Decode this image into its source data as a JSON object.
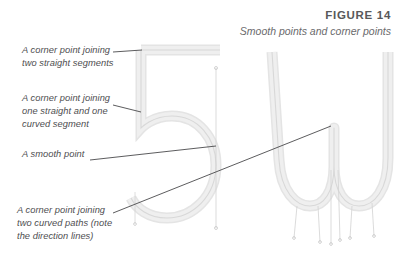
{
  "header": {
    "figure_number": "FIGURE 14",
    "caption": "Smooth points and corner points"
  },
  "annotations": [
    {
      "id": "corner-two-straight",
      "text": "A corner point joining\ntwo straight segments"
    },
    {
      "id": "corner-straight-curve",
      "text": "A corner point joining\none straight and one\ncurved segment"
    },
    {
      "id": "smooth-point",
      "text": "A smooth point"
    },
    {
      "id": "corner-two-curves",
      "text": "A corner point joining\ntwo curved paths (note\nthe direction lines)"
    }
  ],
  "glyphs": [
    {
      "id": "glyph-five",
      "character": "5"
    },
    {
      "id": "glyph-w",
      "character": "W"
    }
  ],
  "colors": {
    "background": "#ffffff",
    "heading": "#58585a",
    "caption": "#6a6a6c",
    "label_text": "#4e4e50",
    "leader_line": "#4a4a4c",
    "glyph_outline": "#d9d9d9",
    "glyph_fill": "#eeeeee",
    "glyph_core": "#cfcfcf",
    "direction_line": "#c9c9c9",
    "anchor_point": "#9a9a9a"
  }
}
